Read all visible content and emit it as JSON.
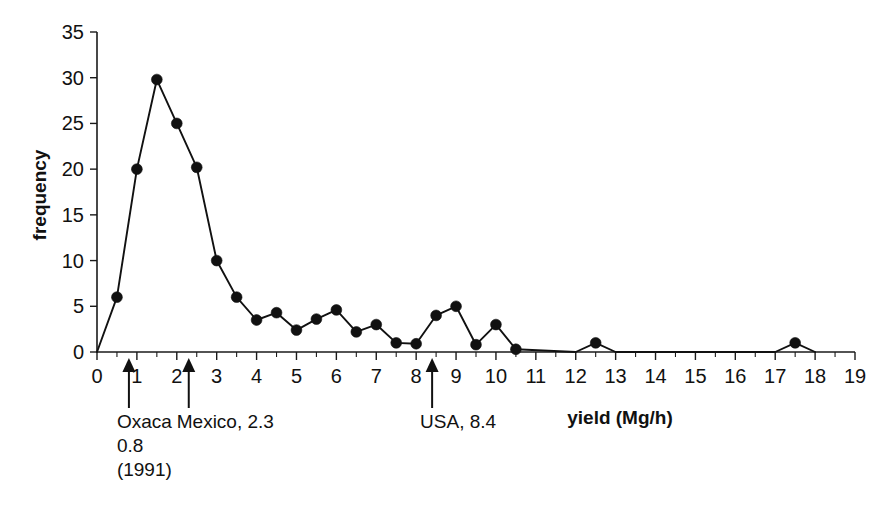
{
  "chart_data": {
    "type": "line",
    "title": "",
    "subtitle": "",
    "xlabel": "yield (Mg/h)",
    "ylabel": "frequency",
    "xlim": [
      0,
      19
    ],
    "ylim": [
      0,
      35
    ],
    "grid": false,
    "legend": "none",
    "x_ticks": [
      0,
      1,
      2,
      3,
      4,
      5,
      6,
      7,
      8,
      9,
      10,
      11,
      12,
      13,
      14,
      15,
      16,
      17,
      18,
      19
    ],
    "x_tick_labels": [
      "0",
      "1",
      "2",
      "3",
      "4",
      "5",
      "6",
      "7",
      "8",
      "9",
      "10",
      "11",
      "12",
      "13",
      "14",
      "15",
      "16",
      "17",
      "18",
      "19"
    ],
    "x_minor_tick_step": 0.5,
    "y_ticks": [
      0,
      5,
      10,
      15,
      20,
      25,
      30,
      35
    ],
    "y_tick_labels": [
      "0",
      "5",
      "10",
      "15",
      "20",
      "25",
      "30",
      "35"
    ],
    "series": [
      {
        "name": "frequency",
        "marker": "filled-circle",
        "color": "#111111",
        "x": [
          0,
          0.5,
          1,
          1.5,
          2,
          2.5,
          3,
          3.5,
          4,
          4.5,
          5,
          5.5,
          6,
          6.5,
          7,
          7.5,
          8,
          8.5,
          9,
          9.5,
          10,
          10.5,
          12,
          12.5,
          13,
          17,
          17.5,
          18
        ],
        "values": [
          0,
          6,
          20,
          29.8,
          25,
          20.2,
          10,
          6,
          3.5,
          4.3,
          2.4,
          3.6,
          4.6,
          2.2,
          3,
          1,
          0.9,
          4,
          5,
          0.8,
          3,
          0.3,
          0,
          1,
          0,
          0,
          1,
          0
        ],
        "points_with_markers": [
          0.5,
          1,
          1.5,
          2,
          2.5,
          3,
          3.5,
          4,
          4.5,
          5,
          5.5,
          6,
          6.5,
          7,
          7.5,
          8,
          8.5,
          9,
          9.5,
          10,
          10.5,
          12.5,
          17.5
        ]
      }
    ],
    "annotations": [
      {
        "id": "oxaca",
        "x": 0.8,
        "label_lines": [
          "Oxaca",
          "0.8",
          "(1991)"
        ],
        "marker": "up-arrow"
      },
      {
        "id": "mexico",
        "x": 2.3,
        "label_lines": [
          "Mexico, 2.3"
        ],
        "marker": "up-arrow"
      },
      {
        "id": "usa",
        "x": 8.4,
        "label_lines": [
          "USA, 8.4"
        ],
        "marker": "up-arrow"
      }
    ]
  },
  "labels": {
    "y_axis_title": "frequency",
    "x_axis_title": "yield (Mg/h)",
    "annot_oxaca_line1": "Oxaca",
    "annot_oxaca_line2": "0.8",
    "annot_oxaca_line3": "(1991)",
    "annot_mexico": "Mexico, 2.3",
    "annot_usa": "USA, 8.4"
  },
  "colors": {
    "background": "#ffffff",
    "foreground": "#111111",
    "series": "#111111"
  }
}
